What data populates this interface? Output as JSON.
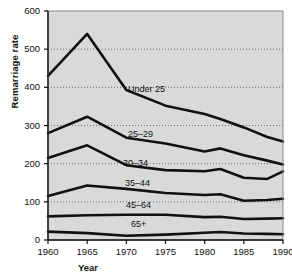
{
  "chart_data": {
    "type": "line",
    "title": "",
    "subtitle": "",
    "xlabel": "Year",
    "ylabel": "Remarriage rate",
    "xlim": [
      1960,
      1990
    ],
    "ylim": [
      0,
      600
    ],
    "yticks": [
      0,
      100,
      200,
      300,
      400,
      500,
      600
    ],
    "xticks": [
      1960,
      1965,
      1970,
      1975,
      1980,
      1985,
      1990
    ],
    "grid": true,
    "grid_style": "dotted-horizontal",
    "legend_position": "inline-annotations",
    "plot_background": "#d9d9d9",
    "line_color": "#111111",
    "x": [
      1960,
      1965,
      1970,
      1975,
      1980,
      1982,
      1985,
      1988,
      1990
    ],
    "series": [
      {
        "name": "Under 25",
        "label": "Under 25",
        "values": [
          430,
          540,
          393,
          352,
          330,
          317,
          295,
          270,
          258
        ],
        "label_pos": {
          "x": 128,
          "y": 84
        }
      },
      {
        "name": "25-29",
        "label": "25–29",
        "values": [
          280,
          323,
          268,
          253,
          232,
          240,
          222,
          208,
          198
        ],
        "label_pos": {
          "x": 128,
          "y": 129
        }
      },
      {
        "name": "30-34",
        "label": "30–34",
        "values": [
          215,
          248,
          196,
          183,
          180,
          186,
          163,
          160,
          180
        ],
        "label_pos": {
          "x": 123,
          "y": 158
        }
      },
      {
        "name": "35-44",
        "label": "35–44",
        "values": [
          115,
          143,
          134,
          123,
          118,
          120,
          103,
          105,
          108
        ],
        "label_pos": {
          "x": 125,
          "y": 178
        }
      },
      {
        "name": "45-64",
        "label": "45–64",
        "values": [
          62,
          65,
          66,
          66,
          60,
          61,
          55,
          56,
          57
        ],
        "label_pos": {
          "x": 126,
          "y": 200
        }
      },
      {
        "name": "65+",
        "label": "65+",
        "values": [
          22,
          18,
          11,
          14,
          19,
          21,
          17,
          16,
          15
        ],
        "label_pos": {
          "x": 131,
          "y": 219
        }
      }
    ]
  },
  "axis": {
    "ylabel": "Remarriage rate",
    "xlabel": "Year",
    "ytick_labels": [
      "600",
      "500",
      "400",
      "300",
      "200",
      "100",
      "0"
    ],
    "xtick_labels": [
      "1960",
      "1965",
      "1970",
      "1975",
      "1980",
      "1985",
      "1990"
    ]
  }
}
